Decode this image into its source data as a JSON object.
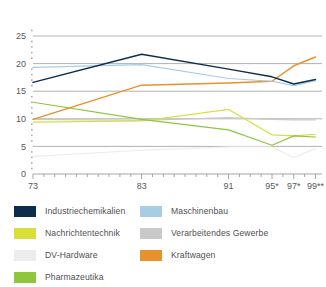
{
  "chart_data": {
    "type": "line",
    "title": "",
    "subtitle": "",
    "xlabel": "",
    "ylabel": "",
    "x": [
      73,
      74,
      75,
      76,
      77,
      78,
      79,
      80,
      81,
      82,
      83,
      84,
      85,
      86,
      87,
      88,
      89,
      90,
      91,
      92,
      93,
      94,
      95,
      96,
      97,
      98,
      99
    ],
    "xtick_values": [
      73,
      83,
      91,
      95,
      97,
      99
    ],
    "xtick_labels": [
      "73",
      "83",
      "91",
      "95*",
      "97*",
      "99**"
    ],
    "ytick_labels": [
      "0",
      "5",
      "10",
      "15",
      "20",
      "25"
    ],
    "ytick_values": [
      0,
      5,
      10,
      15,
      20,
      25
    ],
    "ylim": [
      0,
      27
    ],
    "xlim": [
      73,
      99.6
    ],
    "grid": "horizontal",
    "legend_position": "bottom",
    "series": [
      {
        "name": "Industriechemikalien",
        "color": "#0d2d4e",
        "points": [
          {
            "x": 73,
            "y": 16.6
          },
          {
            "x": 83,
            "y": 21.7
          },
          {
            "x": 91,
            "y": 19.0
          },
          {
            "x": 95,
            "y": 17.6
          },
          {
            "x": 97,
            "y": 16.3
          },
          {
            "x": 99,
            "y": 17.1
          }
        ]
      },
      {
        "name": "Maschinenbau",
        "color": "#a8cbe6",
        "points": [
          {
            "x": 73,
            "y": 19.3
          },
          {
            "x": 83,
            "y": 19.8
          },
          {
            "x": 91,
            "y": 17.3
          },
          {
            "x": 95,
            "y": 16.8
          },
          {
            "x": 97,
            "y": 16.0
          },
          {
            "x": 99,
            "y": 16.9
          }
        ]
      },
      {
        "name": "Kraftwagen",
        "color": "#e8922f",
        "points": [
          {
            "x": 73,
            "y": 9.9
          },
          {
            "x": 83,
            "y": 16.1
          },
          {
            "x": 91,
            "y": 16.5
          },
          {
            "x": 95,
            "y": 16.8
          },
          {
            "x": 97,
            "y": 19.6
          },
          {
            "x": 99,
            "y": 21.2
          }
        ]
      },
      {
        "name": "Verarbeitendes Gewerbe",
        "color": "#c9c9c9",
        "points": [
          {
            "x": 73,
            "y": 9.9
          },
          {
            "x": 83,
            "y": 9.7
          },
          {
            "x": 91,
            "y": 10.2
          },
          {
            "x": 95,
            "y": 9.9
          },
          {
            "x": 97,
            "y": 9.8
          },
          {
            "x": 99,
            "y": 9.8
          }
        ]
      },
      {
        "name": "Nachrichtentechnik",
        "color": "#d7df38",
        "points": [
          {
            "x": 73,
            "y": 9.4
          },
          {
            "x": 83,
            "y": 9.6
          },
          {
            "x": 91,
            "y": 11.7
          },
          {
            "x": 95,
            "y": 7.1
          },
          {
            "x": 97,
            "y": 6.9
          },
          {
            "x": 99,
            "y": 7.2
          }
        ]
      },
      {
        "name": "Pharmazeutika",
        "color": "#8ec63f",
        "points": [
          {
            "x": 73,
            "y": 13.0
          },
          {
            "x": 83,
            "y": 9.9
          },
          {
            "x": 91,
            "y": 8.0
          },
          {
            "x": 95,
            "y": 5.2
          },
          {
            "x": 97,
            "y": 6.9
          },
          {
            "x": 99,
            "y": 6.7
          }
        ]
      },
      {
        "name": "DV-Hardware",
        "color": "#ececec",
        "points": [
          {
            "x": 73,
            "y": 3.2
          },
          {
            "x": 83,
            "y": 4.3
          },
          {
            "x": 91,
            "y": 4.9
          },
          {
            "x": 95,
            "y": 4.9
          },
          {
            "x": 97,
            "y": 3.0
          },
          {
            "x": 99,
            "y": 4.6
          }
        ]
      }
    ]
  },
  "legend": {
    "items": [
      {
        "label": "Industriechemikalien",
        "color": "#0d2d4e",
        "name": "legend-item-industriechemikalien"
      },
      {
        "label": "Maschinenbau",
        "color": "#a8cbe6",
        "name": "legend-item-maschinenbau"
      },
      {
        "label": "Nachrichtentechnik",
        "color": "#d7df38",
        "name": "legend-item-nachrichtentechnik"
      },
      {
        "label": "Verarbeitendes Gewerbe",
        "color": "#c9c9c9",
        "name": "legend-item-verarbeitendes-gewerbe"
      },
      {
        "label": "DV-Hardware",
        "color": "#ececec",
        "name": "legend-item-dv-hardware"
      },
      {
        "label": "Kraftwagen",
        "color": "#e8922f",
        "name": "legend-item-kraftwagen"
      },
      {
        "label": "Pharmazeutika",
        "color": "#8ec63f",
        "name": "legend-item-pharmazeutika"
      }
    ]
  },
  "axis": {
    "y_labels": [
      "25",
      "20",
      "15",
      "10",
      "5",
      "0"
    ],
    "x_labels": [
      "73",
      "83",
      "91",
      "95*",
      "97*",
      "99**"
    ]
  }
}
